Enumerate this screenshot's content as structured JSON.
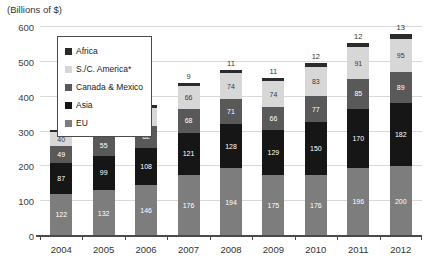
{
  "chart_data": {
    "type": "bar",
    "stacked": true,
    "title": "(Billions of $)",
    "categories": [
      "2004",
      "2005",
      "2006",
      "2007",
      "2008",
      "2009",
      "2010",
      "2011",
      "2012"
    ],
    "series": [
      {
        "name": "EU",
        "color": "#7d7d7d",
        "label_color": "#ffffff",
        "values": [
          122,
          132,
          146,
          176,
          194,
          175,
          176,
          196,
          200
        ]
      },
      {
        "name": "Asia",
        "color": "#161616",
        "label_color": "#ffffff",
        "values": [
          87,
          99,
          108,
          121,
          128,
          129,
          150,
          170,
          182
        ]
      },
      {
        "name": "Canada & Mexico",
        "color": "#595959",
        "label_color": "#ffffff",
        "values": [
          49,
          55,
          62,
          68,
          71,
          66,
          77,
          85,
          89
        ]
      },
      {
        "name": "S./C. America*",
        "color": "#d7d7d7",
        "label_color": "#3a3a3a",
        "values": [
          40,
          42,
          52,
          66,
          74,
          74,
          83,
          91,
          95
        ]
      },
      {
        "name": "Africa",
        "color": "#2b2b2b",
        "label_color": "#333333",
        "values": [
          7,
          7,
          8,
          9,
          11,
          11,
          12,
          12,
          13
        ],
        "labels_outside": true
      }
    ],
    "ylim": [
      0,
      600
    ],
    "yticks": [
      0,
      100,
      200,
      300,
      400,
      500,
      600
    ],
    "grid": true,
    "legend": {
      "position": "upper-left",
      "order": [
        "Africa",
        "S./C. America*",
        "Canada & Mexico",
        "Asia",
        "EU"
      ]
    }
  }
}
